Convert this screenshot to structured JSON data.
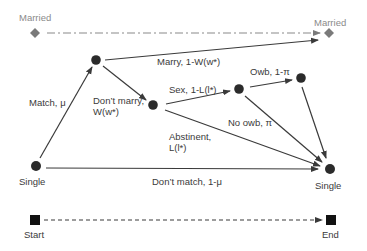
{
  "diagram": {
    "colors": {
      "node": "#2b2b2b",
      "edge": "#3a3a3a",
      "married_marker": "#7a7a7a",
      "married_line": "#8a8a8a",
      "married_text": "#8a8a8a",
      "text": "#3a3a3a",
      "background": "#ffffff"
    },
    "states": {
      "married_left": "Married",
      "married_right": "Married",
      "single_left": "Single",
      "single_right": "Single",
      "start": "Start",
      "end": "End"
    },
    "edges": {
      "match": "Match, μ",
      "marry": "Marry, 1-W(w*)",
      "dont_marry_line1": "Don’t marry,",
      "dont_marry_line2": "W(w*)",
      "sex": "Sex, 1-L(l*)",
      "owb": "Owb, 1-π",
      "no_owb": "No owb, π",
      "abstinent_line1": "Abstinent,",
      "abstinent_line2": "L(l*)",
      "dont_match": "Don’t match, 1-μ"
    },
    "node_icons": {
      "married": "diamond-icon",
      "decision": "circle-node",
      "start_end": "square-icon"
    }
  }
}
